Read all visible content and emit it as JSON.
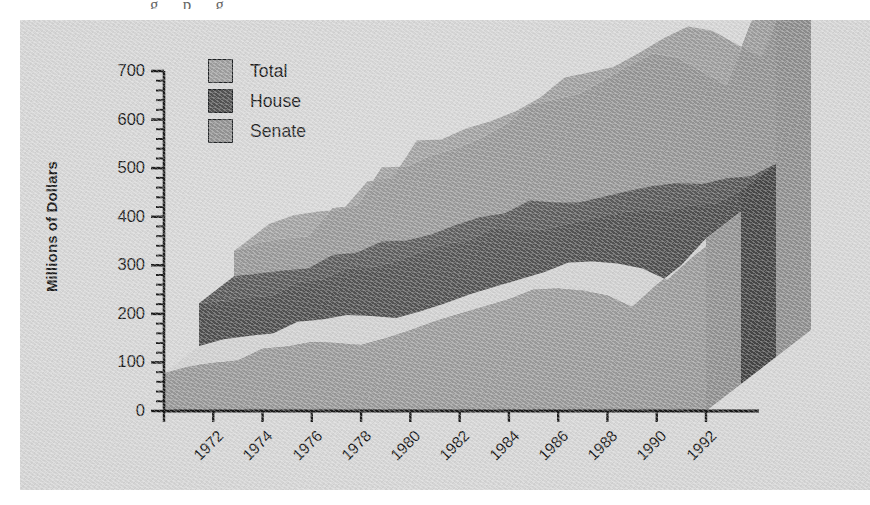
{
  "figure": {
    "top_caption_sliver": "g  p g",
    "plate_bg": "#d3d3d3"
  },
  "axes": {
    "y_title": "Millions of Dollars",
    "y_ticks": [
      "0",
      "100",
      "200",
      "300",
      "400",
      "500",
      "600",
      "700"
    ],
    "y_minor_interval": 20,
    "x_ticks": [
      "1972",
      "1974",
      "1976",
      "1978",
      "1980",
      "1982",
      "1984",
      "1986",
      "1988",
      "1990",
      "1992"
    ]
  },
  "legend": {
    "position": "top-left-inside",
    "entries": [
      {
        "label": "Total",
        "color": "#999999",
        "name": "total"
      },
      {
        "label": "House",
        "color": "#4b4b4b",
        "name": "house"
      },
      {
        "label": "Senate",
        "color": "#8c8c8c",
        "name": "senate"
      }
    ]
  },
  "colors": {
    "total_top": "#9a9a9a",
    "total_front": "#8f8f8f",
    "total_side": "#8a8a8a",
    "house_top": "#4f4f4f",
    "house_front": "#454545",
    "house_side": "#3e3e3e",
    "senate_top": "#cccccc",
    "senate_front": "#949494",
    "senate_side": "#8b8b8b",
    "axis": "#111111",
    "outline": "#15181a"
  },
  "chart_data": {
    "type": "area",
    "title": "",
    "subtitle": "",
    "xlabel": "",
    "ylabel": "Millions of Dollars",
    "ylim": [
      0,
      700
    ],
    "xlim": [
      1972,
      1994
    ],
    "grid": false,
    "legend_position": "top-left",
    "style": "3d-stacked-area",
    "note": "Three overlapping 3-D area ribbons drawn front-to-back: Senate (front), House (middle), Total (back).",
    "x": [
      1972,
      1973,
      1974,
      1975,
      1976,
      1977,
      1978,
      1979,
      1980,
      1981,
      1982,
      1983,
      1984,
      1985,
      1986,
      1987,
      1988,
      1989,
      1990,
      1991,
      1992,
      1993,
      1994
    ],
    "series": [
      {
        "name": "Senate",
        "color": "#949494",
        "values": [
          78,
          92,
          99,
          104,
          128,
          133,
          142,
          140,
          136,
          150,
          166,
          185,
          200,
          215,
          230,
          250,
          252,
          248,
          238,
          214,
          260,
          300,
          355
        ]
      },
      {
        "name": "House",
        "color": "#454545",
        "values": [
          166,
          172,
          178,
          182,
          210,
          215,
          238,
          240,
          252,
          272,
          288,
          296,
          322,
          318,
          318,
          330,
          342,
          352,
          358,
          356,
          368,
          372,
          398
        ]
      },
      {
        "name": "Total",
        "color": "#8f8f8f",
        "values": [
          218,
          236,
          244,
          248,
          306,
          312,
          390,
          392,
          415,
          430,
          450,
          478,
          520,
          530,
          542,
          570,
          600,
          625,
          616,
          588,
          560,
          690,
          740
        ]
      }
    ]
  }
}
